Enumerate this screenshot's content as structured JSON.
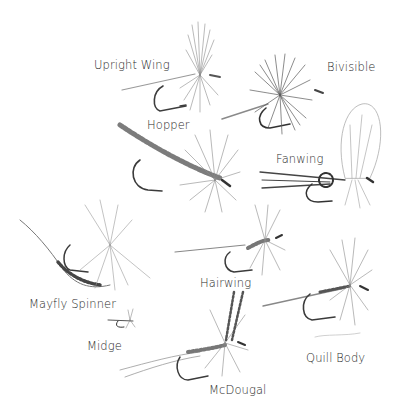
{
  "illustration": {
    "background": "#ffffff",
    "ink_color": "#3a3a3a",
    "label_color": "#2b2b2b",
    "flies": [
      {
        "name": "Upright Wing",
        "label_pos": [
          94,
          58
        ]
      },
      {
        "name": "Bivisible",
        "label_pos": [
          327,
          60
        ]
      },
      {
        "name": "Hopper",
        "label_pos": [
          147,
          118
        ]
      },
      {
        "name": "Fanwing",
        "label_pos": [
          276,
          152
        ]
      },
      {
        "name": "Hairwing",
        "label_pos": [
          200,
          276
        ]
      },
      {
        "name": "Mayfly Spinner",
        "label_pos": [
          29,
          297
        ]
      },
      {
        "name": "Midge",
        "label_pos": [
          87,
          339
        ]
      },
      {
        "name": "Quill Body",
        "label_pos": [
          306,
          351
        ]
      },
      {
        "name": "McDougal",
        "label_pos": [
          209,
          383
        ]
      }
    ]
  }
}
